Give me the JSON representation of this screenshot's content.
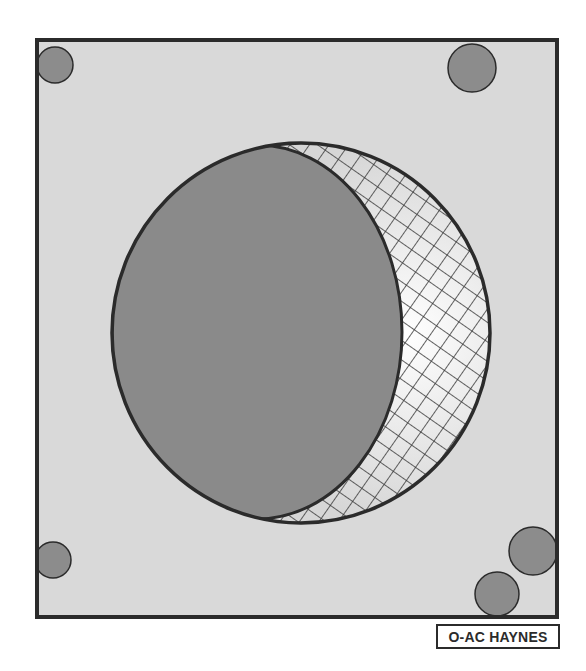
{
  "diagram": {
    "colors": {
      "background": "#ffffff",
      "panel_fill": "#d9d9d9",
      "panel_stroke": "#2b2b2b",
      "disc_fill": "#8a8a8a",
      "crescent_fill": "#e4e4e4",
      "hatch_stroke": "#3a3a3a",
      "bolt_fill": "#8c8c8c"
    },
    "panel": {
      "x": 37,
      "y": 40,
      "width": 520,
      "height": 577
    },
    "outer_circle": {
      "cx": 301,
      "cy": 333,
      "rx": 189,
      "ry": 190
    },
    "inner_disc": {
      "cx": 257,
      "cy": 332,
      "rx": 145,
      "ry": 187
    },
    "corner_circles": [
      {
        "name": "top-left",
        "cx": 55,
        "cy": 65,
        "r": 18
      },
      {
        "name": "top-right",
        "cx": 472,
        "cy": 68,
        "r": 24
      },
      {
        "name": "bottom-left",
        "cx": 53,
        "cy": 560,
        "r": 18
      },
      {
        "name": "bottom-right-upper",
        "cx": 533,
        "cy": 551,
        "r": 24
      },
      {
        "name": "bottom-right-lower",
        "cx": 497,
        "cy": 594,
        "r": 22
      }
    ]
  },
  "label": {
    "text": "O-AC HAYNES"
  }
}
